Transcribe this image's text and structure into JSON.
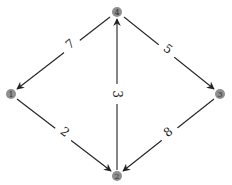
{
  "graph": {
    "type": "directed-weighted",
    "nodes": [
      {
        "id": "4",
        "label": "4",
        "x": 117,
        "y": 12
      },
      {
        "id": "1",
        "label": "1",
        "x": 11,
        "y": 94
      },
      {
        "id": "3",
        "label": "3",
        "x": 220,
        "y": 94
      },
      {
        "id": "2",
        "label": "2",
        "x": 117,
        "y": 176
      }
    ],
    "edges": [
      {
        "from": "4",
        "to": "1",
        "weight": "7"
      },
      {
        "from": "4",
        "to": "3",
        "weight": "5"
      },
      {
        "from": "2",
        "to": "4",
        "weight": "3"
      },
      {
        "from": "1",
        "to": "2",
        "weight": "2"
      },
      {
        "from": "3",
        "to": "2",
        "weight": "8"
      }
    ]
  },
  "colors": {
    "node_fill": "#8f8f8f",
    "edge_stroke": "#222222",
    "background": "#ffffff"
  }
}
